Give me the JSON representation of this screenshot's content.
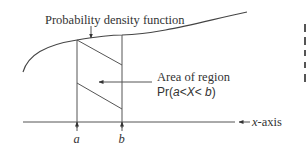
{
  "diagram": {
    "title_label": "Probability density function",
    "region_label_line1": "Area of region",
    "region_label_line2": {
      "prefix": "Pr(",
      "a": "a",
      "lt1": "<",
      "X": "X",
      "lt2": "< ",
      "b": "b",
      "suffix": ")"
    },
    "axis_label": {
      "var": "x",
      "suffix": "-axis"
    },
    "bound_a": "a",
    "bound_b": "b",
    "colors": {
      "line": "#555555",
      "text": "#333333",
      "background": "#ffffff"
    }
  }
}
